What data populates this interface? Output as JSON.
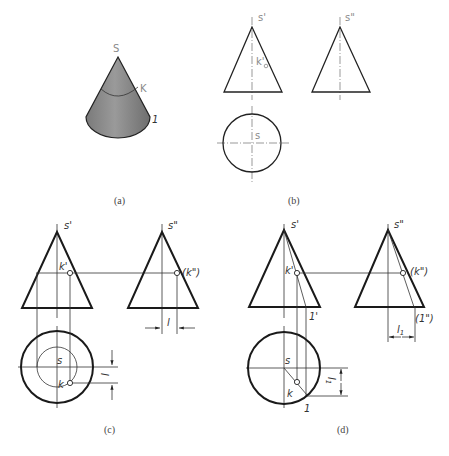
{
  "figure": {
    "panels": [
      {
        "id": "a",
        "caption": "(a)",
        "labels": {
          "apex": "S",
          "point": "K",
          "base_point": "1"
        }
      },
      {
        "id": "b",
        "caption": "(b)",
        "labels": {
          "front_apex": "s'",
          "side_apex": "s\"",
          "front_point": "k'",
          "top_apex": "s"
        }
      },
      {
        "id": "c",
        "caption": "(c)",
        "labels": {
          "front_apex": "s'",
          "side_apex": "s\"",
          "front_point": "k'",
          "side_point": "(k\")",
          "side_dim": "l",
          "top_apex": "s",
          "top_point": "k",
          "top_dim": "l"
        }
      },
      {
        "id": "d",
        "caption": "(d)",
        "labels": {
          "front_apex": "s'",
          "side_apex": "s\"",
          "front_point": "k'",
          "front_base_point": "1'",
          "side_point": "(k\")",
          "side_base_point": "(1\")",
          "side_dim": "l",
          "side_dim_sub": "1",
          "top_apex": "s",
          "top_point": "k",
          "top_base_point": "1",
          "top_dim": "l",
          "top_dim_sub": "1"
        }
      }
    ],
    "colors": {
      "line": "#1a1a1a",
      "cone_fill": "#8c8c8c",
      "label_light": "#8a8a8a"
    }
  }
}
